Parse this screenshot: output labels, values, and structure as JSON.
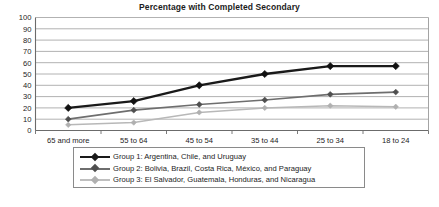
{
  "chart_data": {
    "type": "line",
    "title": "Percentage with Completed Secondary",
    "xlabel": "",
    "ylabel": "",
    "ylim": [
      0,
      100
    ],
    "ytick_step": 10,
    "yticks": [
      0,
      10,
      20,
      30,
      40,
      50,
      60,
      70,
      80,
      90,
      100
    ],
    "grid": true,
    "legend_position": "below",
    "categories": [
      "65 and more",
      "55 to 64",
      "45 to 54",
      "35 to 44",
      "25 to 34",
      "18 to 24"
    ],
    "series": [
      {
        "name": "Group 1: Argentina, Chile, and Uruguay",
        "color": "#1a1a1a",
        "marker": "diamond",
        "values": [
          20,
          26,
          40,
          50,
          57,
          57
        ]
      },
      {
        "name": "Group 2: Bolivia, Brazil, Costa Rica, México, and Paraguay",
        "color": "#6e6e6e",
        "marker": "diamond",
        "values": [
          10,
          18,
          23,
          27,
          32,
          34
        ]
      },
      {
        "name": "Group 3: El Salvador, Guatemala, Honduras, and Nicaragua",
        "color": "#b8b8b8",
        "marker": "diamond",
        "values": [
          5,
          7,
          16,
          20,
          22,
          21
        ]
      }
    ]
  },
  "legend": {
    "entries": [
      "Group 1: Argentina, Chile, and Uruguay",
      "Group 2: Bolivia, Brazil, Costa Rica, México, and Paraguay",
      "Group 3: El Salvador, Guatemala, Honduras, and Nicaragua"
    ]
  },
  "colors": {
    "series1": "#1a1a1a",
    "series2": "#6e6e6e",
    "series3": "#b8b8b8",
    "gridline": "#a9a9a9",
    "axis": "#6b6b6b",
    "plot_border": "#9a9a9a",
    "background": "#ffffff"
  }
}
